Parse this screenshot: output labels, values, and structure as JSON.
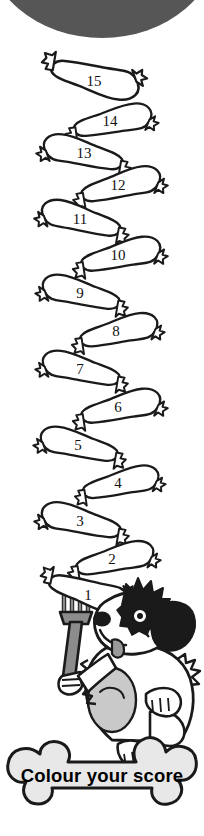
{
  "page": {
    "title": "Colour your score",
    "background_color": "#ffffff",
    "width": 204,
    "height": 836
  },
  "top_arc": {
    "name": "top-dark-arc",
    "color": "#565656",
    "description": "dark grey curved band across the top edge"
  },
  "sausage_chain": {
    "label": "sausage-score-ladder",
    "count": 15,
    "outline_color": "#1a1a1a",
    "fill_color": "#ffffff",
    "order": "bottom-to-top",
    "sausages": [
      {
        "number": "1",
        "lean": "left",
        "cx": 88,
        "cy": 595
      },
      {
        "number": "2",
        "lean": "right",
        "cx": 112,
        "cy": 558
      },
      {
        "number": "3",
        "lean": "left",
        "cx": 82,
        "cy": 520
      },
      {
        "number": "4",
        "lean": "right",
        "cx": 118,
        "cy": 482
      },
      {
        "number": "5",
        "lean": "left",
        "cx": 80,
        "cy": 444
      },
      {
        "number": "6",
        "lean": "right",
        "cx": 120,
        "cy": 406
      },
      {
        "number": "7",
        "lean": "left",
        "cx": 80,
        "cy": 368
      },
      {
        "number": "8",
        "lean": "right",
        "cx": 118,
        "cy": 330
      },
      {
        "number": "9",
        "lean": "left",
        "cx": 82,
        "cy": 292
      },
      {
        "number": "10",
        "lean": "right",
        "cx": 118,
        "cy": 254
      },
      {
        "number": "11",
        "lean": "left",
        "cx": 82,
        "cy": 216
      },
      {
        "number": "12",
        "lean": "right",
        "cx": 118,
        "cy": 180
      },
      {
        "number": "13",
        "lean": "left",
        "cx": 84,
        "cy": 152
      },
      {
        "number": "14",
        "lean": "right",
        "cx": 112,
        "cy": 120
      },
      {
        "number": "15",
        "lean": "left",
        "cx": 94,
        "cy": 80
      }
    ]
  },
  "fork": {
    "name": "fork",
    "color": "#8c8c8c",
    "outline_color": "#1a1a1a",
    "description": "grey fork held by the dog, skewering sausage 1"
  },
  "dog": {
    "name": "cartoon-dog",
    "fur_light": "#ffffff",
    "fur_shadow": "#c9c9c9",
    "fur_dark": "#1a1a1a",
    "tongue_color": "#9a9a9a",
    "description": "scruffy cartoon dog with black ear and head patches holding a fork"
  },
  "bone_banner": {
    "name": "bone-banner",
    "text": "Colour your score",
    "fill_color": "#e8e8e8",
    "outline_color": "#1a1a1a",
    "text_color": "#000000"
  }
}
